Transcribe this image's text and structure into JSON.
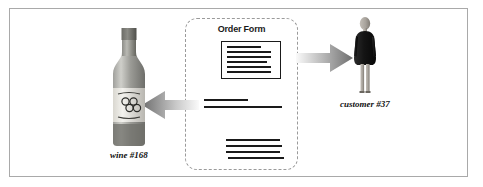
{
  "diagram": {
    "frame_border_color": "#a9a9a9",
    "background_color": "#ffffff",
    "ink_color": "#1a1a1a"
  },
  "order_form": {
    "title": "Order Form",
    "border_style": "dashed",
    "border_color": "#9a9a9a",
    "document_box": {
      "name": "order-form-document",
      "line_widths_pct": [
        70,
        92,
        92,
        84,
        92,
        92
      ]
    },
    "mid_line_group": {
      "name": "order-line-item-group-middle",
      "line_widths_pct": [
        56,
        100
      ]
    },
    "bottom_line_group": {
      "name": "order-line-item-group-bottom",
      "line_widths_pct": [
        96,
        100,
        96,
        100
      ]
    }
  },
  "wine": {
    "caption": "wine #168",
    "label_logo": "grape-cluster-icon",
    "cap_color": "#6f6f6f",
    "body_color": "#8c8c8c",
    "label_color": "#e8e6e0"
  },
  "customer": {
    "caption": "customer #37",
    "dress_color": "#1e1e1e",
    "skin_color": "#a8a39c"
  },
  "arrows": [
    {
      "name": "arrow-order-to-customer",
      "direction": "right",
      "from": "Order Form",
      "to": "customer #37",
      "color_head": "#6e6e6e",
      "color_tail": "#f2f2f2"
    },
    {
      "name": "arrow-order-to-wine",
      "direction": "left",
      "from": "Order Form",
      "to": "wine #168",
      "color_head": "#6e6e6e",
      "color_tail": "#f2f2f2"
    }
  ]
}
